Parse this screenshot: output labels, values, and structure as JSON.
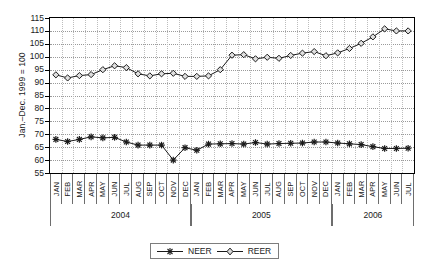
{
  "chart_data": {
    "type": "line",
    "title": "",
    "xlabel": "",
    "ylabel": "Jan.–Dec. 1999 = 100",
    "ylim": [
      55,
      115
    ],
    "yticks": [
      55,
      60,
      65,
      70,
      75,
      80,
      85,
      90,
      95,
      100,
      105,
      110,
      115
    ],
    "grid": true,
    "legend_position": "bottom-center",
    "months": [
      "JAN",
      "FEB",
      "MAR",
      "APR",
      "MAY",
      "JUN",
      "JUL",
      "AUG",
      "SEP",
      "OCT",
      "NOV",
      "DEC"
    ],
    "years": [
      {
        "label": "2006",
        "months": 7
      },
      {
        "label": "2005",
        "months": 12
      },
      {
        "label": "2004",
        "months": 12
      }
    ],
    "year_order": [
      "2004",
      "2005",
      "2006"
    ],
    "categories": [
      "2004-JAN",
      "2004-FEB",
      "2004-MAR",
      "2004-APR",
      "2004-MAY",
      "2004-JUN",
      "2004-JUL",
      "2004-AUG",
      "2004-SEP",
      "2004-OCT",
      "2004-NOV",
      "2004-DEC",
      "2005-JAN",
      "2005-FEB",
      "2005-MAR",
      "2005-APR",
      "2005-MAY",
      "2005-JUN",
      "2005-JUL",
      "2005-AUG",
      "2005-SEP",
      "2005-OCT",
      "2005-NOV",
      "2005-DEC",
      "2006-JAN",
      "2006-FEB",
      "2006-MAR",
      "2006-APR",
      "2006-MAY",
      "2006-JUN",
      "2006-JUL"
    ],
    "series": [
      {
        "name": "NEER",
        "marker": "asterisk",
        "color": "#1a1a1a",
        "values": [
          68.0,
          67.2,
          68.0,
          69.0,
          68.6,
          68.8,
          67.0,
          65.8,
          65.8,
          65.8,
          60.0,
          64.8,
          63.8,
          66.2,
          66.3,
          66.4,
          66.2,
          66.8,
          66.2,
          66.4,
          66.5,
          66.6,
          67.0,
          67.0,
          66.6,
          66.3,
          66.0,
          65.2,
          64.5,
          64.5,
          64.6
        ]
      },
      {
        "name": "REER",
        "marker": "diamond",
        "color": "#1a1a1a",
        "values": [
          93.0,
          91.8,
          92.7,
          93.1,
          95.0,
          96.5,
          95.8,
          93.4,
          92.6,
          93.4,
          93.6,
          92.4,
          92.4,
          92.6,
          95.0,
          100.6,
          100.8,
          99.2,
          99.8,
          99.4,
          100.5,
          101.4,
          102.0,
          100.4,
          101.5,
          103.2,
          105.2,
          107.7,
          110.8,
          110.0,
          110.0
        ]
      }
    ],
    "legend": [
      {
        "label": "NEER",
        "marker": "asterisk"
      },
      {
        "label": "REER",
        "marker": "diamond"
      }
    ]
  }
}
